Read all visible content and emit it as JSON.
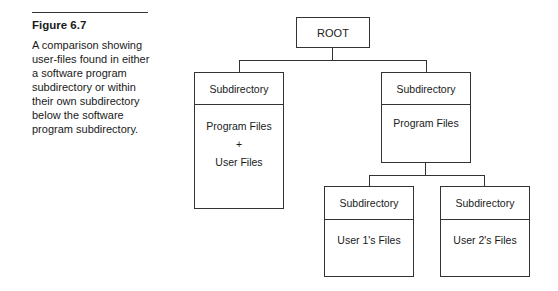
{
  "figure": {
    "label": "Figure 6.7",
    "caption": "A comparison showing user-files found in either a software program subdirectory or within their own subdirectory below the software program subdirectory."
  },
  "diagram": {
    "root": {
      "label": "ROOT"
    },
    "left": {
      "header": "Subdirectory",
      "lines": [
        "Program Files",
        "+",
        "User Files"
      ]
    },
    "right": {
      "header": "Subdirectory",
      "lines": [
        "Program Files"
      ]
    },
    "right_children": [
      {
        "header": "Subdirectory",
        "lines": [
          "User 1's Files"
        ]
      },
      {
        "header": "Subdirectory",
        "lines": [
          "User 2's Files"
        ]
      }
    ]
  }
}
